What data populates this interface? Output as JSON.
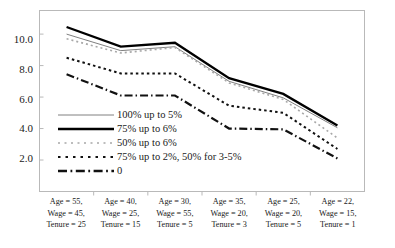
{
  "chart_data": {
    "type": "line",
    "title": "",
    "subtitle": "",
    "xlabel": "",
    "ylabel": "",
    "grid": false,
    "legend_position": "inside-lower-left",
    "ylim": [
      0,
      11.5
    ],
    "yticks": [
      "2.0",
      "4.0",
      "6.0",
      "8.0",
      "10.0"
    ],
    "ytick_values": [
      2.0,
      4.0,
      6.0,
      8.0,
      10.0
    ],
    "categories": [
      "Age = 55, Wage = 45, Tenure = 25",
      "Age = 40, Wage = 25, Tenure = 15",
      "Age = 30, Wage = 55, Tenure = 5",
      "Age = 35, Wage = 20, Tenure = 3",
      "Age = 25, Wage = 20, Tenure = 5",
      "Age = 22, Wage = 15, Tenure = 1"
    ],
    "category_lines": [
      [
        "Age = 55,",
        "Wage = 45,",
        "Tenure = 25"
      ],
      [
        "Age = 40,",
        "Wage = 25,",
        "Tenure = 15"
      ],
      [
        "Age = 30,",
        "Wage = 55,",
        "Tenure = 5"
      ],
      [
        "Age = 35,",
        "Wage = 20,",
        "Tenure = 3"
      ],
      [
        "Age = 25,",
        "Wage = 20,",
        "Tenure = 5"
      ],
      [
        "Age = 22,",
        "Wage = 15,",
        "Tenure = 1"
      ]
    ],
    "series": [
      {
        "name": "100% up to 5%",
        "style": "thin-solid",
        "color": "#808080",
        "width": 1.0,
        "dash": "",
        "values": [
          10.0,
          8.95,
          9.2,
          7.0,
          5.95,
          4.05
        ]
      },
      {
        "name": "75% up to 6%",
        "style": "thick-solid",
        "color": "#000000",
        "width": 2.3,
        "dash": "",
        "values": [
          10.45,
          9.2,
          9.45,
          7.2,
          6.2,
          4.2
        ]
      },
      {
        "name": "50% up to 6%",
        "style": "light-dotted",
        "color": "#a8a8a8",
        "width": 1.6,
        "dash": "2,3",
        "values": [
          9.7,
          8.8,
          9.15,
          6.9,
          5.85,
          3.4
        ]
      },
      {
        "name": "75% up to 2%, 50% for 3-5%",
        "style": "bold-dotted",
        "color": "#111111",
        "width": 2.0,
        "dash": "2.5,3",
        "values": [
          8.5,
          7.5,
          7.5,
          5.45,
          5.0,
          2.7
        ]
      },
      {
        "name": "0",
        "style": "dash-dot",
        "color": "#111111",
        "width": 2.2,
        "dash": "8,3,1.5,3",
        "values": [
          7.45,
          6.1,
          6.1,
          4.0,
          3.95,
          2.1
        ]
      }
    ]
  }
}
